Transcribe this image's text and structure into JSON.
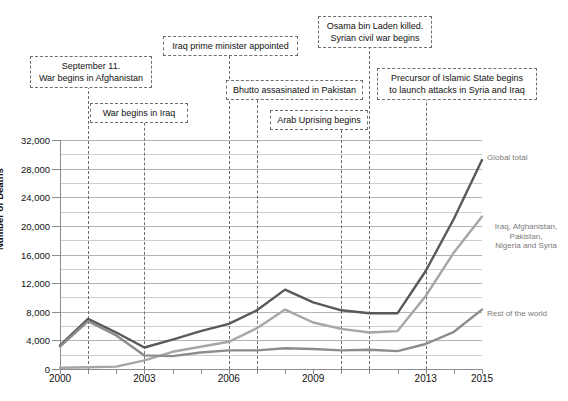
{
  "chart_data": {
    "type": "line",
    "title": "",
    "xlabel": "",
    "ylabel": "Number of Deaths",
    "x": [
      2000,
      2001,
      2002,
      2003,
      2004,
      2005,
      2006,
      2007,
      2008,
      2009,
      2010,
      2011,
      2012,
      2013,
      2014,
      2015
    ],
    "xlim": [
      2000,
      2015
    ],
    "ylim": [
      0,
      32000
    ],
    "ytick_values": [
      0,
      4000,
      8000,
      12000,
      16000,
      20000,
      24000,
      28000,
      32000
    ],
    "ytick_labels": [
      "0",
      "4,000",
      "8,000",
      "12,000",
      "16,000",
      "20,000",
      "24,000",
      "28,000",
      "32,000"
    ],
    "yminor_step": 2000,
    "xtick_labels": [
      "2000",
      "2003",
      "2006",
      "2009",
      "2013",
      "2015"
    ],
    "xtick_positions": [
      2000,
      2003,
      2006,
      2009,
      2013,
      2015
    ],
    "grid": "horizontal",
    "legend": "series-end-labels",
    "series": [
      {
        "name": "Global total",
        "color": "#595959",
        "values": [
          3300,
          7000,
          5100,
          3000,
          4100,
          5300,
          6300,
          8200,
          11100,
          9300,
          8200,
          7800,
          7800,
          13700,
          21000,
          29200
        ]
      },
      {
        "name": "Iraq, Afghanistan, Pakistan, Nigeria and Syria",
        "color": "#a6a6a6",
        "values": [
          180,
          250,
          330,
          1200,
          2400,
          3100,
          3800,
          5700,
          8300,
          6500,
          5600,
          5100,
          5300,
          10200,
          16300,
          21300
        ]
      },
      {
        "name": "Rest of the world",
        "color": "#8c8c8c",
        "values": [
          3150,
          6700,
          4700,
          1900,
          1800,
          2300,
          2600,
          2600,
          2900,
          2800,
          2600,
          2700,
          2500,
          3500,
          5200,
          8300
        ]
      }
    ],
    "annotations": [
      {
        "id": "sept-11",
        "text": "September 11.\nWar begins in Afghanistan",
        "year": 2001
      },
      {
        "id": "war-iraq",
        "text": "War begins in Iraq",
        "year": 2003
      },
      {
        "id": "iraq-pm",
        "text": "Iraq prime minister appointed",
        "year": 2006
      },
      {
        "id": "bhutto",
        "text": "Bhutto assasinated in Pakistan",
        "year": 2007
      },
      {
        "id": "arab-uprising",
        "text": "Arab Uprising begins",
        "year": 2010
      },
      {
        "id": "bin-laden",
        "text": "Osama bin Laden killed.\nSyrian civil war begins",
        "year": 2011
      },
      {
        "id": "islamic-state",
        "text": "Precursor of Islamic State begins\nto launch attacks in Syria and Iraq",
        "year": 2013
      }
    ]
  }
}
